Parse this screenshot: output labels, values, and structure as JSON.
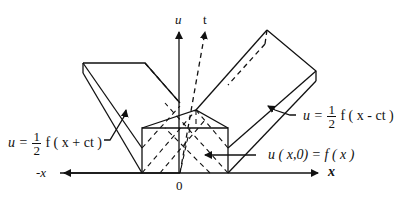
{
  "axes": {
    "u_label": "u",
    "t_label": "t",
    "x_pos_label": "x",
    "x_neg_label": "-x",
    "origin_label": "0"
  },
  "equations": {
    "left_wave": {
      "lhs": "u =",
      "num": "1",
      "den": "2",
      "rhs": "f ( x + ct )"
    },
    "right_wave": {
      "lhs": "u =",
      "num": "1",
      "den": "2",
      "rhs": "f ( x - ct )"
    },
    "initial": {
      "text": "u ( x,0) = f ( x )"
    }
  },
  "colors": {
    "line": "#111111",
    "background": "#ffffff"
  }
}
